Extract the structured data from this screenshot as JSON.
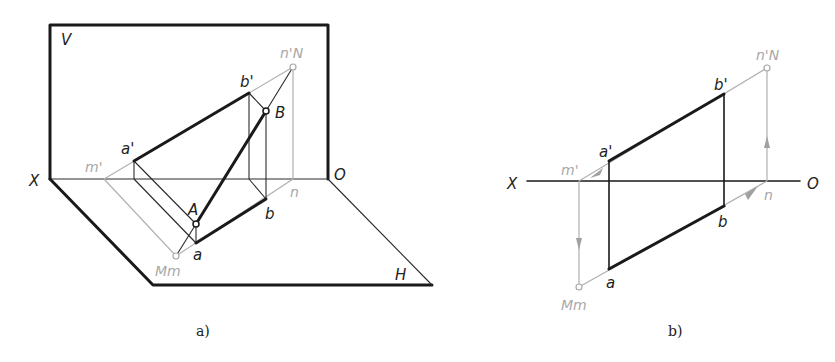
{
  "figures": [
    {
      "id": "a",
      "caption": "a)",
      "type": "axonometric projection view",
      "planes": {
        "vertical": "V",
        "horizontal": "H"
      },
      "axis": {
        "left": "X",
        "right": "O"
      },
      "labels": {
        "a_prime": "a'",
        "b_prime": "b'",
        "n_prime_N": "n'N",
        "B": "B",
        "m_prime": "m'",
        "A": "A",
        "a": "a",
        "b": "b",
        "n": "n",
        "Mm": "Mm"
      }
    },
    {
      "id": "b",
      "caption": "b)",
      "type": "orthographic projection",
      "axis": {
        "left": "X",
        "right": "O"
      },
      "labels": {
        "a_prime": "a'",
        "b_prime": "b'",
        "n_prime_N": "n'N",
        "m_prime": "m'",
        "a": "a",
        "b": "b",
        "n": "n",
        "Mm": "Mm"
      }
    }
  ],
  "colors": {
    "line": "#1a1a1a",
    "construction": "#b0b0b0",
    "background": "#ffffff"
  }
}
